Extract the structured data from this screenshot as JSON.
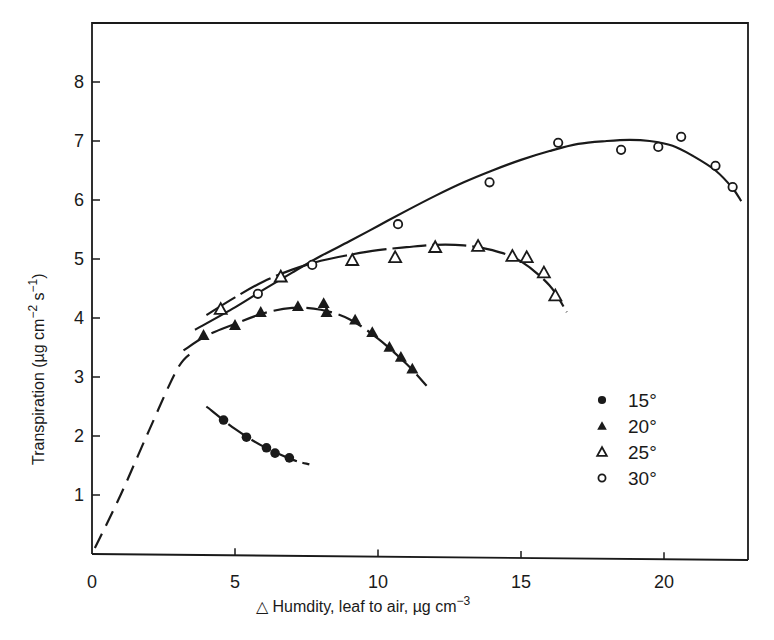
{
  "chart_data": {
    "type": "scatter",
    "title": "",
    "xlabel": "△ Humdity, leaf to air, µg cm⁻³",
    "ylabel": "Transpiration (µg cm⁻² s⁻¹)",
    "xlim": [
      0,
      23
    ],
    "ylim": [
      0,
      8.8
    ],
    "xticks": [
      0,
      5,
      10,
      15,
      20
    ],
    "yticks": [
      1,
      2,
      3,
      4,
      5,
      6,
      7,
      8
    ],
    "grid": false,
    "legend_position": "right-middle",
    "series": [
      {
        "name": "15°",
        "marker": "filled-circle",
        "x": [
          4.6,
          5.4,
          6.1,
          6.4,
          6.9
        ],
        "y": [
          2.27,
          1.98,
          1.8,
          1.71,
          1.63
        ],
        "fit_curve": [
          [
            4.0,
            2.5
          ],
          [
            5.0,
            2.12
          ],
          [
            6.0,
            1.82
          ],
          [
            7.0,
            1.6
          ],
          [
            7.6,
            1.52
          ]
        ]
      },
      {
        "name": "20°",
        "marker": "filled-triangle",
        "x": [
          3.9,
          5.0,
          5.9,
          7.2,
          8.1,
          8.2,
          9.2,
          9.8,
          10.4,
          10.8,
          11.2
        ],
        "y": [
          3.71,
          3.88,
          4.1,
          4.2,
          4.25,
          4.1,
          3.97,
          3.76,
          3.51,
          3.34,
          3.14
        ],
        "fit_curve": [
          [
            3.2,
            3.45
          ],
          [
            4.0,
            3.7
          ],
          [
            5.0,
            3.9
          ],
          [
            6.0,
            4.08
          ],
          [
            7.0,
            4.17
          ],
          [
            8.0,
            4.14
          ],
          [
            9.0,
            3.98
          ],
          [
            10.0,
            3.65
          ],
          [
            11.0,
            3.22
          ],
          [
            11.7,
            2.85
          ]
        ]
      },
      {
        "name": "25°",
        "marker": "open-triangle",
        "x": [
          4.5,
          6.6,
          9.1,
          10.6,
          12.0,
          13.5,
          14.7,
          15.2,
          15.8,
          16.2
        ],
        "y": [
          4.15,
          4.7,
          4.98,
          5.03,
          5.2,
          5.22,
          5.05,
          5.03,
          4.77,
          4.38
        ],
        "fit_curve": [
          [
            4.0,
            4.05
          ],
          [
            5.0,
            4.35
          ],
          [
            6.0,
            4.62
          ],
          [
            7.0,
            4.82
          ],
          [
            8.0,
            4.97
          ],
          [
            9.0,
            5.07
          ],
          [
            10.0,
            5.15
          ],
          [
            11.0,
            5.2
          ],
          [
            12.0,
            5.24
          ],
          [
            13.0,
            5.23
          ],
          [
            14.0,
            5.15
          ],
          [
            15.0,
            4.96
          ],
          [
            16.0,
            4.55
          ],
          [
            16.6,
            4.1
          ]
        ]
      },
      {
        "name": "30°",
        "marker": "open-circle",
        "x": [
          5.8,
          7.7,
          10.7,
          13.9,
          16.3,
          18.5,
          19.8,
          20.6,
          21.8,
          22.4
        ],
        "y": [
          4.41,
          4.9,
          5.59,
          6.3,
          6.97,
          6.85,
          6.9,
          7.07,
          6.58,
          6.22
        ],
        "fit_curve": [
          [
            3.6,
            3.8
          ],
          [
            5.0,
            4.18
          ],
          [
            6.0,
            4.48
          ],
          [
            7.0,
            4.77
          ],
          [
            8.0,
            5.05
          ],
          [
            9.0,
            5.3
          ],
          [
            10.0,
            5.56
          ],
          [
            11.0,
            5.82
          ],
          [
            12.0,
            6.07
          ],
          [
            13.0,
            6.3
          ],
          [
            14.0,
            6.5
          ],
          [
            15.0,
            6.68
          ],
          [
            16.0,
            6.83
          ],
          [
            17.0,
            6.95
          ],
          [
            18.0,
            7.0
          ],
          [
            18.8,
            7.02
          ],
          [
            19.5,
            7.0
          ],
          [
            20.3,
            6.92
          ],
          [
            21.0,
            6.75
          ],
          [
            21.8,
            6.5
          ],
          [
            22.4,
            6.2
          ],
          [
            22.7,
            5.98
          ]
        ]
      },
      {
        "name": "extrapolation (dashed)",
        "marker": "none",
        "fit_curve": [
          [
            0.1,
            0.1
          ],
          [
            1.0,
            1.0
          ],
          [
            2.0,
            2.1
          ],
          [
            3.0,
            3.15
          ],
          [
            3.6,
            3.45
          ]
        ]
      }
    ]
  },
  "axes": {
    "x_ticks": [
      "0",
      "5",
      "10",
      "15",
      "20"
    ],
    "y_ticks": [
      "1",
      "2",
      "3",
      "4",
      "5",
      "6",
      "7",
      "8"
    ],
    "x_title": "△ Humdity, leaf to air, µg cm",
    "x_title_sup": "−3",
    "y_title_main": "Transpiration (µg cm",
    "y_title_sup1": "−2",
    "y_title_mid": " s",
    "y_title_sup2": "−1",
    "y_title_end": ")"
  },
  "legend": {
    "items": [
      {
        "label": "15°",
        "marker": "filled-circle"
      },
      {
        "label": "20°",
        "marker": "filled-triangle"
      },
      {
        "label": "25°",
        "marker": "open-triangle"
      },
      {
        "label": "30°",
        "marker": "open-circle"
      }
    ]
  },
  "colors": {
    "ink": "#1a1a1a",
    "background": "#ffffff"
  }
}
